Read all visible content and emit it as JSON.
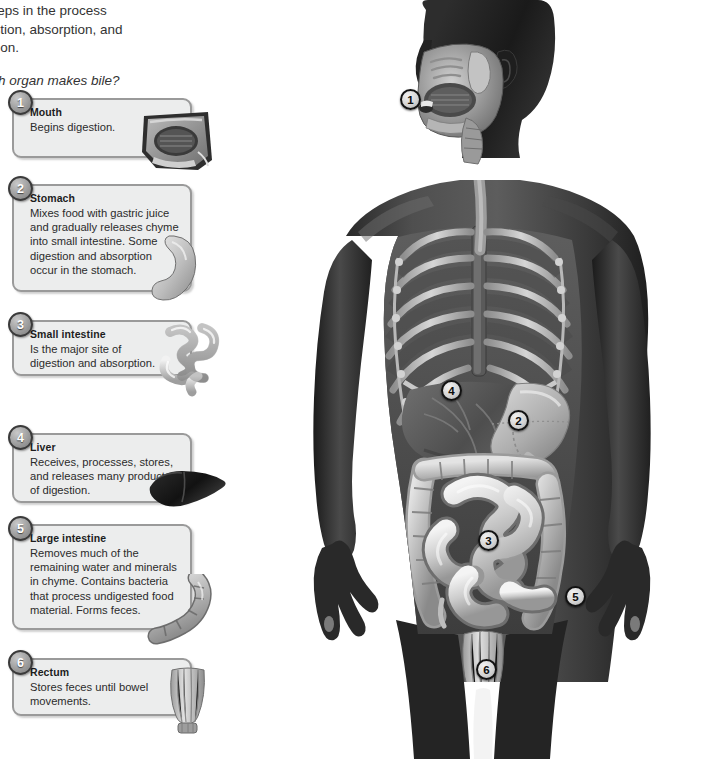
{
  "intro": {
    "paragraph": "jor steps in the process\ndigestion, absorption, and\nnination.",
    "question": "Which organ makes bile?"
  },
  "callouts": [
    {
      "number": "1",
      "title": "Mouth",
      "body": "Begins digestion.",
      "organ_icon": "mouth-sagittal-section"
    },
    {
      "number": "2",
      "title": "Stomach",
      "body": "Mixes food with gastric juice\nand gradually releases chyme\ninto small intestine. Some\ndigestion and absorption\noccur in the stomach.",
      "organ_icon": "stomach"
    },
    {
      "number": "3",
      "title": "Small intestine",
      "body": "Is the major site of\ndigestion and absorption.",
      "organ_icon": "small-intestine"
    },
    {
      "number": "4",
      "title": "Liver",
      "body": "Receives, processes, stores,\nand releases many products\nof digestion.",
      "organ_icon": "liver"
    },
    {
      "number": "5",
      "title": "Large intestine",
      "body": "Removes much of the\nremaining water and minerals\nin chyme. Contains bacteria\nthat process undigested food\nmaterial. Forms feces.",
      "organ_icon": "large-intestine"
    },
    {
      "number": "6",
      "title": "Rectum",
      "body": "Stores feces until bowel\nmovements.",
      "organ_icon": "rectum"
    }
  ],
  "figure": {
    "markers": [
      {
        "number": "1",
        "organ": "mouth"
      },
      {
        "number": "2",
        "organ": "stomach"
      },
      {
        "number": "3",
        "organ": "small-intestine"
      },
      {
        "number": "4",
        "organ": "liver"
      },
      {
        "number": "5",
        "organ": "large-intestine"
      },
      {
        "number": "6",
        "organ": "rectum"
      }
    ]
  },
  "colors": {
    "callout_fill": "#eceded",
    "callout_border": "#9a9a9a",
    "badge_ring": "#3a3a3a",
    "text": "#2b2b2b",
    "background": "#ffffff"
  }
}
